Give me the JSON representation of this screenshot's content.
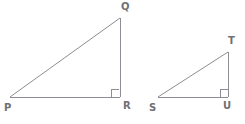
{
  "figure": {
    "kind": "geometry-diagram",
    "stroke_color": "#8d8d93",
    "label_color": "#6f6f75",
    "background_color": "#ffffff",
    "stroke_width": 1,
    "triangles": [
      {
        "name": "triangle-pqr",
        "vertices": [
          {
            "label": "P",
            "x": 10,
            "y": 97,
            "label_x": 5,
            "label_y": 104,
            "right_angle": false
          },
          {
            "label": "Q",
            "x": 120,
            "y": 18,
            "label_x": 122,
            "label_y": 2,
            "right_angle": false
          },
          {
            "label": "R",
            "x": 120,
            "y": 97,
            "label_x": 123,
            "label_y": 102,
            "right_angle": true
          }
        ],
        "right_angle_marker": {
          "x": 111,
          "y": 88,
          "size": 8
        }
      },
      {
        "name": "triangle-stu",
        "vertices": [
          {
            "label": "S",
            "x": 158,
            "y": 97,
            "label_x": 150,
            "label_y": 104,
            "right_angle": false
          },
          {
            "label": "T",
            "x": 228,
            "y": 52,
            "label_x": 228,
            "label_y": 36,
            "right_angle": false
          },
          {
            "label": "U",
            "x": 228,
            "y": 97,
            "label_x": 224,
            "label_y": 102,
            "right_angle": true
          }
        ],
        "right_angle_marker": {
          "x": 220,
          "y": 89,
          "size": 8
        }
      }
    ]
  },
  "labels": {
    "p": "P",
    "q": "Q",
    "r": "R",
    "s": "S",
    "t": "T",
    "u": "U"
  }
}
